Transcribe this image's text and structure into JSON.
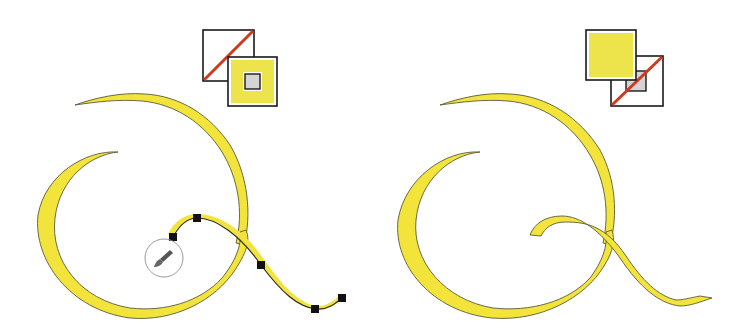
{
  "colors": {
    "ribbon_fill": "#f2e43a",
    "ribbon_stroke": "#5a5a3a",
    "swatch_border": "#1a1a1a",
    "swatch_yellow": "#ece44a",
    "swatch_gray": "#d4d4d4",
    "none_slash": "#d2381c",
    "anchor": "#111111",
    "brush_circle": "#9a9a9a",
    "background": "#ffffff"
  },
  "panels": [
    {
      "id": "before",
      "swatch": {
        "front": "stroke",
        "back": "fill",
        "fill_state": "none",
        "stroke_state": "yellow"
      },
      "selected_path_anchor_count": 6,
      "cursor": "paintbrush-cursor"
    },
    {
      "id": "after",
      "swatch": {
        "front": "fill",
        "back": "stroke",
        "fill_state": "yellow",
        "stroke_state": "none"
      },
      "selected_path_anchor_count": 0
    }
  ]
}
